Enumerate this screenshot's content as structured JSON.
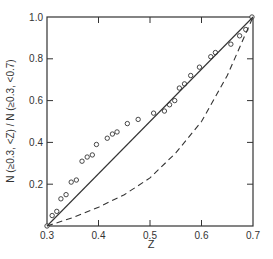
{
  "chart_data": {
    "type": "line",
    "title": "",
    "xlabel": "Z",
    "ylabel": "N (≥0.3, <Z) / N (≥0.3, <0.7)",
    "xlim": [
      0.3,
      0.7
    ],
    "ylim": [
      0.0,
      1.0
    ],
    "grid": false,
    "legend": null,
    "x_ticks": [
      "0.3",
      "0.4",
      "0.5",
      "0.6",
      "0.7"
    ],
    "y_ticks": [
      "0.2",
      "0.4",
      "0.6",
      "0.8",
      "1.0"
    ],
    "series": [
      {
        "name": "observed",
        "style": "open-circles",
        "x": [
          0.3,
          0.31,
          0.319,
          0.327,
          0.337,
          0.347,
          0.357,
          0.368,
          0.378,
          0.388,
          0.396,
          0.417,
          0.427,
          0.436,
          0.456,
          0.477,
          0.507,
          0.528,
          0.538,
          0.548,
          0.557,
          0.567,
          0.579,
          0.596,
          0.618,
          0.627,
          0.657,
          0.674,
          0.686,
          0.698
        ],
        "y": [
          0.0,
          0.05,
          0.07,
          0.13,
          0.15,
          0.21,
          0.22,
          0.31,
          0.33,
          0.34,
          0.39,
          0.42,
          0.44,
          0.45,
          0.49,
          0.51,
          0.54,
          0.55,
          0.58,
          0.6,
          0.66,
          0.68,
          0.72,
          0.76,
          0.81,
          0.83,
          0.87,
          0.91,
          0.94,
          1.0
        ]
      },
      {
        "name": "uniform (linear)",
        "style": "solid-line",
        "x": [
          0.3,
          0.7
        ],
        "y": [
          0.0,
          1.0
        ]
      },
      {
        "name": "model (curved)",
        "style": "dashed-line",
        "x": [
          0.3,
          0.35,
          0.4,
          0.45,
          0.5,
          0.55,
          0.6,
          0.65,
          0.7
        ],
        "y": [
          0.0,
          0.04,
          0.09,
          0.15,
          0.23,
          0.35,
          0.5,
          0.72,
          1.0
        ]
      }
    ]
  }
}
